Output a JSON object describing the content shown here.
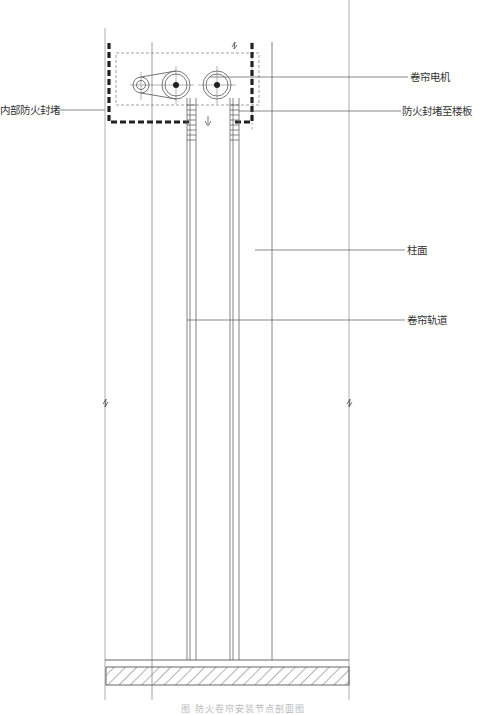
{
  "drawing": {
    "type": "section",
    "subject": "fire shutter installation section"
  },
  "labels": {
    "motor": "卷帘电机",
    "inner_fire_seal": "内部防火封堵",
    "fire_seal_to_slab": "防火封堵至楼板",
    "column_face": "柱面",
    "shutter_track": "卷帘轨道"
  },
  "caption": "图 防火卷帘安装节点剖面图",
  "colors": {
    "line": "#555555",
    "faint_line": "#aaaaaa",
    "seal": "#222222",
    "hatch": "#666666"
  }
}
